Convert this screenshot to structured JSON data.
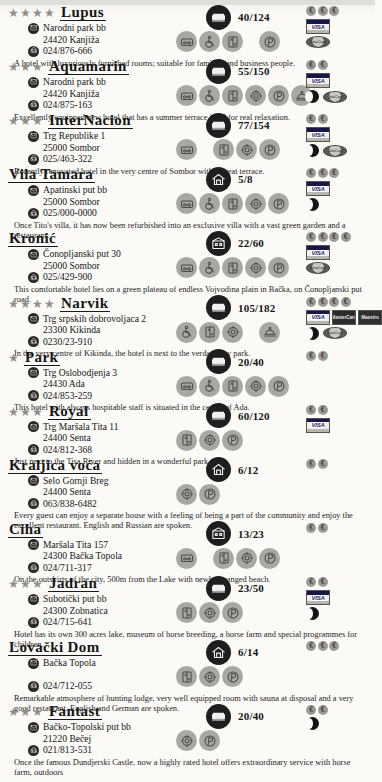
{
  "document": {
    "title": "Hotel listings directory — Vojvodina",
    "type": "printed-catalogue-page"
  },
  "labels": {
    "address_icon": "envelope-icon",
    "phone_icon": "phone-icon",
    "capacity_icon": "bed-icon",
    "star_glyph": "★",
    "euro_glyph": "€",
    "visa_label": "VISA",
    "mastercard_label": "MasterCard",
    "maestro_label": "Maestro",
    "dina_label": "DinaCard"
  },
  "hotels": [
    {
      "name": "Lupus",
      "stars": 4,
      "street": "Narodni park bb",
      "city": "24420 Kanjiža",
      "phone": "024/876-666",
      "capacity": "40/124",
      "capacity_icon": "bed-icon",
      "amenities": [
        "tv-icon",
        "wheelchair-icon",
        "lift-icon"
      ],
      "amenities_tail": [
        "parking-icon"
      ],
      "price_coins": 3,
      "cards": [
        "visa"
      ],
      "extras": [
        "dina"
      ],
      "description": "A hotel with luxuriously furnished rooms; suitable for families and business people."
    },
    {
      "name": "Aquamarin",
      "stars": 3,
      "street": "Narodni park bb",
      "city": "24420 Kanjiža",
      "phone": "024/875-163",
      "capacity": "55/150",
      "capacity_icon": "bed-icon",
      "amenities": [
        "tv-icon",
        "wheelchair-icon",
        "lift-icon",
        "restaurant-icon",
        "parking-icon",
        "roomservice-icon"
      ],
      "amenities_tail": [],
      "price_coins": 2,
      "cards": [
        "visa"
      ],
      "extras": [
        "moon",
        "dina"
      ],
      "description": "Excellently equipped new hotel that has a summer terrace ideal for real relaxation."
    },
    {
      "name": "InterNacion",
      "stars": 3,
      "street": "Trg Republike 1",
      "city": "25000 Sombor",
      "phone": "025/463-322",
      "capacity": "77/154",
      "capacity_icon": "bed-icon",
      "amenities": [
        "tv-icon"
      ],
      "amenities_tail": [
        "lift-icon",
        "restaurant-icon",
        "parking-icon"
      ],
      "price_coins": 2,
      "cards": [
        "visa"
      ],
      "extras": [
        "moon",
        "dina"
      ],
      "description": "Recently renovated hotel in the very centre of Sombor with a great terrace."
    },
    {
      "name": "Vila Tamara",
      "stars": 0,
      "street": "Apatinski put bb",
      "city": "25000 Sombor",
      "phone": "025/000-0000",
      "capacity": "5/8",
      "capacity_icon": "villa-icon",
      "amenities": [
        "tv-icon",
        "wheelchair-icon",
        "lift-icon",
        "restaurant-icon",
        "parking-icon"
      ],
      "amenities_tail": [],
      "price_coins": 3,
      "cards": [
        "visa"
      ],
      "extras": [
        "moon"
      ],
      "description": "Once Tito's villa, it has now been refurbished into an exclusive villa with a vast green garden and a restaurant."
    },
    {
      "name": "Kronić",
      "stars": 0,
      "street": "Čonopljanski put 30",
      "city": "25000 Sombor",
      "phone": "025/429-900",
      "capacity": "22/60",
      "capacity_icon": "house-icon",
      "amenities": [
        "tv-icon",
        "wheelchair-icon",
        "lift-icon",
        "restaurant-icon",
        "parking-icon"
      ],
      "amenities_tail": [],
      "price_coins": 4,
      "cards": [
        "visa"
      ],
      "extras": [
        "dina"
      ],
      "description": "This comfortable hotel lies on a green plateau of endless Vojvodina plain in Bačka, on Čonopljanski put road."
    },
    {
      "name": "Narvik",
      "stars": 4,
      "street": "Trg srpskih dobrovoljaca 2",
      "city": "23300 Kikinda",
      "phone": "0230/23-910",
      "capacity": "105/182",
      "capacity_icon": "bed-icon",
      "amenities": [
        "wheelchair-icon",
        "lift-icon",
        "restaurant-icon"
      ],
      "amenities_tail": [
        "roomservice-icon"
      ],
      "price_coins": 4,
      "cards": [
        "visa",
        "mc",
        "maestro"
      ],
      "extras": [
        "moon",
        "dina"
      ],
      "description": "In the very centre of Kikinda, the hotel is next to the verdant city park."
    },
    {
      "name": "Park",
      "stars": 1,
      "street": "Trg Oslobodjenja 3",
      "city": "24430 Ada",
      "phone": "024/853-259",
      "capacity": "20/40",
      "capacity_icon": "bed-icon",
      "amenities": [
        "tv-icon",
        "wheelchair-icon",
        "lift-icon",
        "restaurant-icon",
        "parking-icon"
      ],
      "amenities_tail": [],
      "price_coins": 2,
      "cards": [],
      "extras": [],
      "description": "This hotel with always hospitable staff is situated in the centre of Ada."
    },
    {
      "name": "Royal",
      "stars": 3,
      "street": "Trg Maršala Tita 11",
      "city": "24400 Senta",
      "phone": "024/812-368",
      "capacity": "60/120",
      "capacity_icon": "bed-icon",
      "amenities": [
        "lift-icon",
        "restaurant-icon",
        "parking-icon"
      ],
      "amenities_tail": [],
      "price_coins": 2,
      "cards": [
        "visa"
      ],
      "extras": [],
      "description": "Just next to the Tisa River and hidden in a wonderful park."
    },
    {
      "name": "Kraljica voća",
      "stars": 0,
      "street": "Selo Gornji Breg",
      "city": "24400 Senta",
      "phone": "063/838-6482",
      "capacity": "6/12",
      "capacity_icon": "villa-icon",
      "amenities": [
        "restaurant-icon",
        "parking-icon"
      ],
      "amenities_tail": [],
      "price_coins": 2,
      "cards": [],
      "extras": [],
      "description": "Every guest can enjoy a separate house with a feeling of being a part of the community and enjoy the excellent restaurant. English and Russian are spoken."
    },
    {
      "name": "Ciha",
      "stars": 0,
      "street": "Maršala Tita 157",
      "city": "24300 Bačka Topola",
      "phone": "024/711-317",
      "capacity": "13/23",
      "capacity_icon": "house-icon",
      "amenities": [
        "tv-icon"
      ],
      "amenities_tail": [
        "lift-icon",
        "restaurant-icon",
        "parking-icon"
      ],
      "price_coins": 2,
      "cards": [],
      "extras": [],
      "description": "On the outskirts of the city, 500m from the Lake with newly arranged beach."
    },
    {
      "name": "Jadran",
      "stars": 3,
      "street": "Subotički put bb",
      "city": "24300 Zobnatica",
      "phone": "024/715-641",
      "capacity": "23/50",
      "capacity_icon": "bed-icon",
      "amenities": [
        "lift-icon",
        "restaurant-icon",
        "parking-icon"
      ],
      "amenities_tail": [],
      "price_coins": 2,
      "cards": [
        "visa"
      ],
      "extras": [
        "moon"
      ],
      "description": "Hotel has its own 300 acres lake, museum of horse breeding, a horse farm and special programmes for children."
    },
    {
      "name": "Lovački Dom",
      "stars": 0,
      "street": "Bačka Topola",
      "city": "",
      "phone": "024/712-055",
      "capacity": "6/14",
      "capacity_icon": "villa-icon",
      "amenities": [
        "lift-icon",
        "restaurant-icon",
        "parking-icon"
      ],
      "amenities_tail": [],
      "price_coins": 3,
      "cards": [],
      "extras": [],
      "description": "Remarkable atmosphere of hunting lodge, very well equipped room with sauna at disposal and a very good restaurant. English and German are spoken."
    },
    {
      "name": "Fantast",
      "stars": 3,
      "street": "Bačko-Topolski put bb",
      "city": "21220 Bečej",
      "phone": "021/813-531",
      "capacity": "20/40",
      "capacity_icon": "bed-icon",
      "amenities": [
        "restaurant-icon",
        "parking-icon"
      ],
      "amenities_tail": [],
      "price_coins": 2,
      "cards": [],
      "extras": [
        "moon"
      ],
      "description": "Once the famous Dundjerski Castle, now a highly rated hotel offers extraordinary service with horse farm, outdoors"
    }
  ]
}
